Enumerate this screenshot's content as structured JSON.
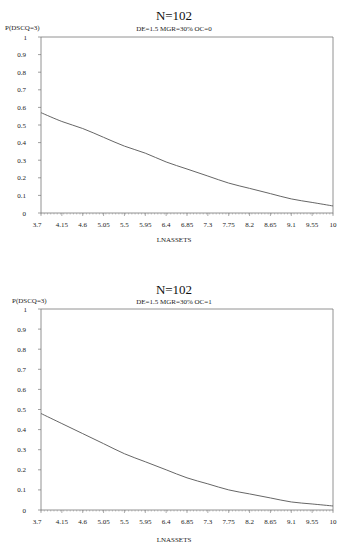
{
  "chart_data": [
    {
      "type": "line",
      "title": "N=102",
      "subtitle": "DE=1.5 MGR=30% OC=0",
      "xlabel": "LNASSETS",
      "ylabel": "P(DSCQ=3)",
      "x_ticks": [
        "3.7",
        "4.15",
        "4.6",
        "5.05",
        "5.5",
        "5.95",
        "6.4",
        "6.85",
        "7.3",
        "7.75",
        "8.2",
        "8.65",
        "9.1",
        "9.55",
        "10"
      ],
      "y_ticks": [
        "0",
        "0.1",
        "0.2",
        "0.3",
        "0.4",
        "0.5",
        "0.6",
        "0.7",
        "0.8",
        "0.9",
        "1"
      ],
      "xlim": [
        3.7,
        10
      ],
      "ylim": [
        0,
        1
      ],
      "grid": false,
      "series": [
        {
          "name": "P(DSCQ=3)",
          "x": [
            3.7,
            4.15,
            4.6,
            5.05,
            5.5,
            5.95,
            6.4,
            6.85,
            7.3,
            7.75,
            8.2,
            8.65,
            9.1,
            9.55,
            10
          ],
          "values": [
            0.57,
            0.52,
            0.48,
            0.43,
            0.38,
            0.34,
            0.29,
            0.25,
            0.21,
            0.17,
            0.14,
            0.11,
            0.08,
            0.06,
            0.04
          ]
        }
      ]
    },
    {
      "type": "line",
      "title": "N=102",
      "subtitle": "DE=1.5 MGR=30% OC=1",
      "xlabel": "LNASSETS",
      "ylabel": "P(DSCQ=3)",
      "x_ticks": [
        "3.7",
        "4.15",
        "4.6",
        "5.05",
        "5.5",
        "5.95",
        "6.4",
        "6.85",
        "7.3",
        "7.75",
        "8.2",
        "8.65",
        "9.1",
        "9.55",
        "10"
      ],
      "y_ticks": [
        "0",
        "0.1",
        "0.2",
        "0.3",
        "0.4",
        "0.5",
        "0.6",
        "0.7",
        "0.8",
        "0.9",
        "1"
      ],
      "xlim": [
        3.7,
        10
      ],
      "ylim": [
        0,
        1
      ],
      "grid": false,
      "series": [
        {
          "name": "P(DSCQ=3)",
          "x": [
            3.7,
            4.15,
            4.6,
            5.05,
            5.5,
            5.95,
            6.4,
            6.85,
            7.3,
            7.75,
            8.2,
            8.65,
            9.1,
            9.55,
            10
          ],
          "values": [
            0.48,
            0.43,
            0.38,
            0.33,
            0.28,
            0.24,
            0.2,
            0.16,
            0.13,
            0.1,
            0.08,
            0.06,
            0.04,
            0.03,
            0.02
          ]
        }
      ]
    }
  ]
}
